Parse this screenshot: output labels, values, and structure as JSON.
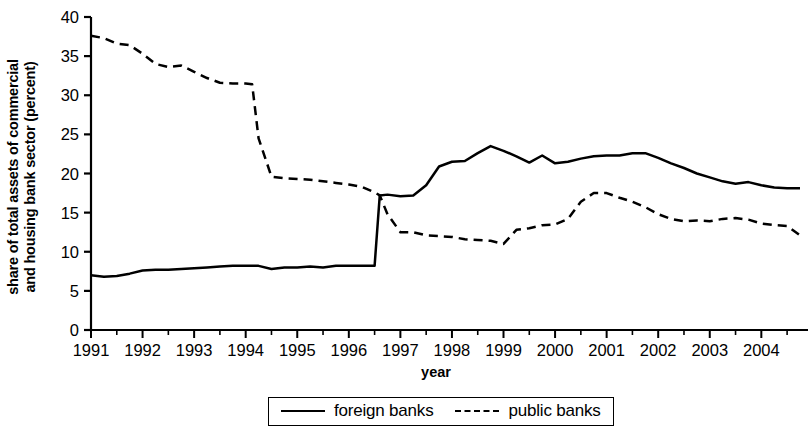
{
  "chart_data": {
    "type": "line",
    "title": "",
    "xlabel": "year",
    "ylabel": "share of total assets of commercial and housing bank sector (percent)",
    "ylabel_line1": "share of total assets of commercial",
    "ylabel_line2": "and housing bank sector (percent)",
    "xlim": [
      1991,
      2004.75
    ],
    "ylim": [
      0,
      40
    ],
    "yticks": [
      0,
      5,
      10,
      15,
      20,
      25,
      30,
      35,
      40
    ],
    "ytick_labels": [
      "0",
      "5",
      "10",
      "15",
      "20",
      "25",
      "30",
      "35",
      "40"
    ],
    "xticks": [
      1991,
      1992,
      1993,
      1994,
      1995,
      1996,
      1997,
      1998,
      1999,
      2000,
      2001,
      2002,
      2003,
      2004
    ],
    "xtick_labels": [
      "1991",
      "1992",
      "1993",
      "1994",
      "1995",
      "1996",
      "1997",
      "1998",
      "1999",
      "2000",
      "2001",
      "2002",
      "2003",
      "2004"
    ],
    "grid": false,
    "legend_position": "bottom-center",
    "line_color": "#000000",
    "x": [
      1991.0,
      1991.25,
      1991.5,
      1991.75,
      1992.0,
      1992.25,
      1992.5,
      1992.75,
      1993.0,
      1993.25,
      1993.5,
      1993.75,
      1994.0,
      1994.125,
      1994.25,
      1994.5,
      1994.75,
      1995.0,
      1995.25,
      1995.5,
      1995.75,
      1996.0,
      1996.25,
      1996.5,
      1996.6,
      1996.75,
      1997.0,
      1997.25,
      1997.5,
      1997.75,
      1998.0,
      1998.25,
      1998.5,
      1998.75,
      1999.0,
      1999.25,
      1999.5,
      1999.75,
      2000.0,
      2000.25,
      2000.5,
      2000.75,
      2001.0,
      2001.25,
      2001.5,
      2001.75,
      2002.0,
      2002.25,
      2002.5,
      2002.75,
      2003.0,
      2003.25,
      2003.5,
      2003.75,
      2004.0,
      2004.25,
      2004.5,
      2004.75
    ],
    "series": [
      {
        "name": "foreign banks",
        "style": "solid",
        "values": [
          7.0,
          6.8,
          6.9,
          7.2,
          7.6,
          7.7,
          7.7,
          7.8,
          7.9,
          8.0,
          8.1,
          8.2,
          8.2,
          8.2,
          8.2,
          7.8,
          8.0,
          8.0,
          8.1,
          8.0,
          8.2,
          8.2,
          8.2,
          8.2,
          17.2,
          17.3,
          17.1,
          17.2,
          18.5,
          20.9,
          21.5,
          21.6,
          22.6,
          23.5,
          22.9,
          22.2,
          21.4,
          22.3,
          21.3,
          21.5,
          21.9,
          22.2,
          22.3,
          22.3,
          22.6,
          22.6,
          22.0,
          21.3,
          20.7,
          20.0,
          19.5,
          19.0,
          18.7,
          18.9,
          18.5,
          18.2,
          18.1,
          18.1
        ]
      },
      {
        "name": "public banks",
        "style": "dashed",
        "values": [
          37.6,
          37.3,
          36.6,
          36.4,
          35.3,
          34.0,
          33.6,
          33.8,
          33.0,
          32.2,
          31.6,
          31.5,
          31.5,
          31.4,
          24.5,
          19.6,
          19.4,
          19.3,
          19.2,
          19.0,
          18.8,
          18.6,
          18.3,
          17.6,
          17.2,
          14.8,
          12.5,
          12.5,
          12.1,
          12.0,
          11.9,
          11.6,
          11.5,
          11.4,
          11.0,
          12.8,
          13.0,
          13.4,
          13.5,
          14.2,
          16.4,
          17.5,
          17.5,
          16.9,
          16.4,
          15.7,
          14.8,
          14.2,
          13.9,
          14.0,
          13.9,
          14.2,
          14.3,
          14.1,
          13.6,
          13.4,
          13.3,
          12.1
        ]
      }
    ]
  },
  "legend": {
    "items": [
      {
        "label": "foreign banks",
        "style": "solid"
      },
      {
        "label": "public banks",
        "style": "dashed"
      }
    ]
  }
}
